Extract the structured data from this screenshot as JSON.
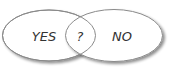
{
  "diagram": {
    "type": "venn",
    "sets": [
      {
        "label": "YES"
      },
      {
        "label": "NO"
      }
    ],
    "intersection": {
      "label": "?"
    }
  },
  "colors": {
    "stroke": "#8a8a8a",
    "fill": "#ffffff",
    "shadow": "#cfcfcf",
    "text": "#333333"
  }
}
